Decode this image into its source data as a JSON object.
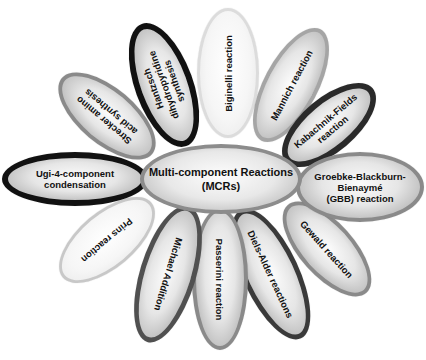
{
  "diagram": {
    "center": {
      "label": "Multi-component Reactions\n(MCRs)"
    },
    "petals": [
      {
        "id": "strecker",
        "label": "Strecker amino\nacid synthesis",
        "border": "gray"
      },
      {
        "id": "hantzsch",
        "label": "Hantzsch\ndihydropyridine\nsynthesis",
        "border": "black"
      },
      {
        "id": "biginelli",
        "label": "Biginelli reaction",
        "border": "light"
      },
      {
        "id": "mannich",
        "label": "Mannich reaction",
        "border": "gray"
      },
      {
        "id": "kabachnik",
        "label": "Kabachnik-Fields\nreaction",
        "border": "black"
      },
      {
        "id": "gbb",
        "label": "Groebke-Blackburn-\nBienaymé\n(GBB) reaction",
        "border": "gray"
      },
      {
        "id": "gewald",
        "label": "Gewald reaction",
        "border": "gray"
      },
      {
        "id": "diels-alder",
        "label": "Diels-Alder reactions",
        "border": "dark"
      },
      {
        "id": "passerini",
        "label": "Passerini reaction",
        "border": "gray"
      },
      {
        "id": "michael",
        "label": "Michael Addition",
        "border": "dark"
      },
      {
        "id": "prins",
        "label": "Prins reaction",
        "border": "light-gray"
      },
      {
        "id": "ugi",
        "label": "Ugi-4-component\ncondensation",
        "border": "black"
      }
    ]
  }
}
